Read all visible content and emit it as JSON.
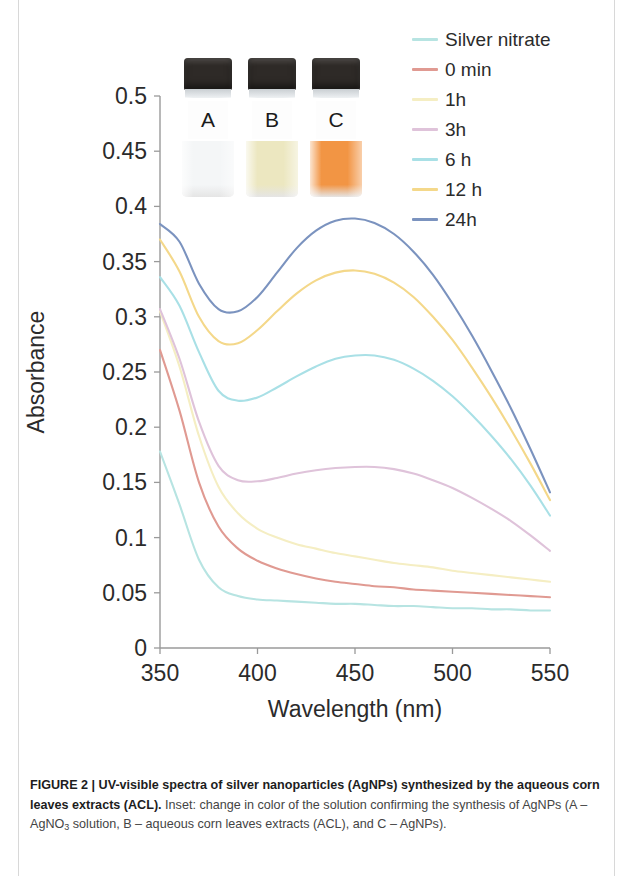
{
  "figure": {
    "axis_color": "#9a9a9a",
    "tick_label_color": "#2b2b2b"
  },
  "legend": {
    "items": [
      {
        "label": "Silver nitrate",
        "color": "#b7e4e2"
      },
      {
        "label": "0 min",
        "color": "#e09a92"
      },
      {
        "label": "1h",
        "color": "#f5eec3"
      },
      {
        "label": "3h",
        "color": "#dfc3da"
      },
      {
        "label": "6 h",
        "color": "#a9e0e6"
      },
      {
        "label": "12 h",
        "color": "#f4d88a"
      },
      {
        "label": "24h",
        "color": "#7b93bf"
      }
    ]
  },
  "inset": {
    "vials": [
      {
        "letter": "A",
        "liquid_color": "#f4f6f7",
        "cap_color": "#2e2a27"
      },
      {
        "letter": "B",
        "liquid_color": "#ece7c0",
        "cap_color": "#2e2a27"
      },
      {
        "letter": "C",
        "liquid_color": "#f29544",
        "cap_color": "#2e2a27"
      }
    ]
  },
  "caption": {
    "bold_lead": "FIGURE 2 | UV-visible spectra of silver nanoparticles (AgNPs) synthesized by the aqueous corn leaves extracts (ACL).",
    "rest_1": " Inset: change in color of the solution confirming the synthesis of AgNPs (A – AgNO",
    "sub_1": "3",
    "rest_2": " solution, B – aqueous corn leaves extracts (ACL), and C – AgNPs)."
  },
  "chart_data": {
    "type": "line",
    "title": "UV-visible spectra of silver nanoparticles (AgNPs)",
    "xlabel": "Wavelength (nm)",
    "ylabel": "Absorbance",
    "xlim": [
      350,
      550
    ],
    "ylim": [
      0,
      0.5
    ],
    "xticks": [
      350,
      400,
      450,
      500,
      550
    ],
    "xtick_labels": [
      "350",
      "400",
      "450",
      "500",
      "550"
    ],
    "yticks": [
      0,
      0.05,
      0.1,
      0.15,
      0.2,
      0.25,
      0.3,
      0.35,
      0.4,
      0.45,
      0.5
    ],
    "ytick_labels": [
      "0",
      "0.05",
      "0.1",
      "0.15",
      "0.2",
      "0.25",
      "0.3",
      "0.35",
      "0.4",
      "0.45",
      "0.5"
    ],
    "grid": false,
    "legend_position": "top-right",
    "x": [
      350,
      360,
      370,
      380,
      390,
      400,
      410,
      420,
      430,
      440,
      450,
      460,
      470,
      480,
      490,
      500,
      510,
      520,
      530,
      540,
      550
    ],
    "series": [
      {
        "name": "Silver nitrate",
        "color": "#b7e4e2",
        "values": [
          0.178,
          0.13,
          0.08,
          0.055,
          0.047,
          0.044,
          0.043,
          0.042,
          0.041,
          0.04,
          0.04,
          0.039,
          0.038,
          0.038,
          0.037,
          0.036,
          0.036,
          0.035,
          0.035,
          0.034,
          0.034
        ]
      },
      {
        "name": "0 min",
        "color": "#e09a92",
        "values": [
          0.27,
          0.215,
          0.15,
          0.11,
          0.09,
          0.079,
          0.072,
          0.067,
          0.063,
          0.06,
          0.058,
          0.056,
          0.055,
          0.053,
          0.052,
          0.051,
          0.05,
          0.049,
          0.048,
          0.047,
          0.046
        ]
      },
      {
        "name": "1h",
        "color": "#f5eec3",
        "values": [
          0.305,
          0.255,
          0.192,
          0.146,
          0.122,
          0.108,
          0.1,
          0.094,
          0.09,
          0.086,
          0.083,
          0.08,
          0.077,
          0.075,
          0.073,
          0.07,
          0.068,
          0.066,
          0.064,
          0.062,
          0.06
        ]
      },
      {
        "name": "3h",
        "color": "#dfc3da",
        "values": [
          0.307,
          0.262,
          0.205,
          0.165,
          0.152,
          0.151,
          0.154,
          0.158,
          0.161,
          0.163,
          0.164,
          0.164,
          0.162,
          0.158,
          0.152,
          0.145,
          0.136,
          0.126,
          0.115,
          0.102,
          0.088
        ]
      },
      {
        "name": "6 h",
        "color": "#a9e0e6",
        "values": [
          0.336,
          0.31,
          0.268,
          0.233,
          0.224,
          0.227,
          0.236,
          0.246,
          0.255,
          0.262,
          0.265,
          0.265,
          0.261,
          0.253,
          0.242,
          0.228,
          0.211,
          0.192,
          0.171,
          0.147,
          0.12
        ]
      },
      {
        "name": "12 h",
        "color": "#f4d88a",
        "values": [
          0.37,
          0.341,
          0.3,
          0.278,
          0.276,
          0.288,
          0.305,
          0.321,
          0.333,
          0.34,
          0.342,
          0.339,
          0.331,
          0.318,
          0.3,
          0.279,
          0.254,
          0.227,
          0.198,
          0.167,
          0.134
        ]
      },
      {
        "name": "24h",
        "color": "#7b93bf",
        "values": [
          0.384,
          0.368,
          0.33,
          0.307,
          0.305,
          0.318,
          0.34,
          0.362,
          0.378,
          0.387,
          0.389,
          0.385,
          0.375,
          0.359,
          0.338,
          0.312,
          0.283,
          0.251,
          0.217,
          0.18,
          0.141
        ]
      }
    ]
  }
}
